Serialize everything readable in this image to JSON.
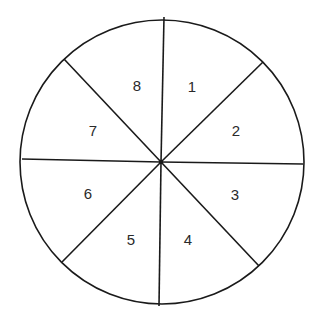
{
  "diagram": {
    "type": "circle divided into 8 sectors",
    "center": [
      161,
      162
    ],
    "radius": 143,
    "stroke_color": "#1a1a1a",
    "spokes": [
      {
        "x": 164,
        "y": 17
      },
      {
        "x": 263,
        "y": 62
      },
      {
        "x": 303,
        "y": 164
      },
      {
        "x": 259,
        "y": 266
      },
      {
        "x": 159,
        "y": 306
      },
      {
        "x": 62,
        "y": 262
      },
      {
        "x": 22,
        "y": 159
      },
      {
        "x": 64,
        "y": 59
      }
    ],
    "sectors": [
      {
        "label": "1",
        "x": 192,
        "y": 86
      },
      {
        "label": "2",
        "x": 236,
        "y": 130
      },
      {
        "label": "3",
        "x": 235,
        "y": 194
      },
      {
        "label": "4",
        "x": 188,
        "y": 239
      },
      {
        "label": "5",
        "x": 131,
        "y": 239
      },
      {
        "label": "6",
        "x": 88,
        "y": 193
      },
      {
        "label": "7",
        "x": 93,
        "y": 130
      },
      {
        "label": "8",
        "x": 137,
        "y": 85
      }
    ]
  }
}
